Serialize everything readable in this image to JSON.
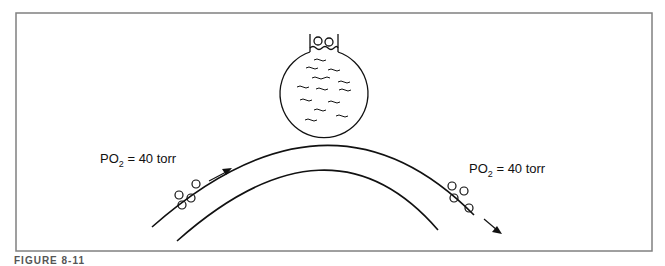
{
  "figure": {
    "caption": "FIGURE 8-11",
    "colors": {
      "frame": "#808080",
      "stroke": "#111111",
      "background": "#ffffff"
    },
    "flask": {
      "contents": "liquid",
      "bubbles_at_neck": 2
    },
    "capillary": {
      "left_label": {
        "prefix": "PO",
        "subscript": "2",
        "suffix": " = 40 torr"
      },
      "right_label": {
        "prefix": "PO",
        "subscript": "2",
        "suffix": " = 40 torr"
      },
      "flow_direction": "left-to-right",
      "left_red_cells": 4,
      "right_red_cells": 4
    }
  }
}
